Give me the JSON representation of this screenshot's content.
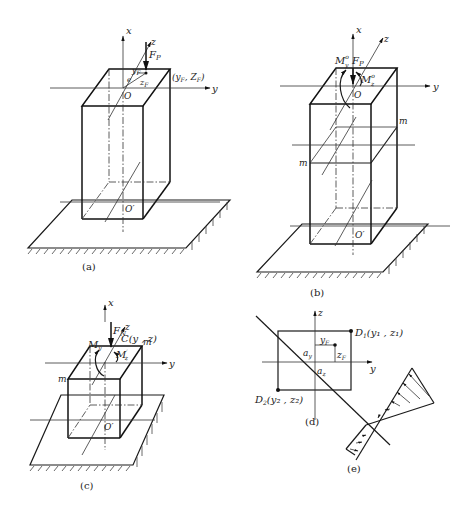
{
  "figure": {
    "panels": [
      {
        "id": "a",
        "caption": "(a)",
        "labels": {
          "x_axis": "x",
          "y_axis": "y",
          "z_axis": "z",
          "force": "F",
          "force_sub": "P",
          "origin": "O",
          "base_origin": "O′",
          "ecc": "e",
          "yF": "y",
          "yF_sub": "F",
          "zF": "z",
          "zF_sub": "F",
          "point": "(y",
          "point_sub1": "F",
          "point_mid": ", Z",
          "point_sub2": "F",
          "point_end": ")"
        }
      },
      {
        "id": "b",
        "caption": "(b)",
        "labels": {
          "x_axis": "x",
          "y_axis": "y",
          "z_axis": "z",
          "force": "F",
          "force_sub": "P",
          "moment_y": "M",
          "moment_y_sub": "y",
          "moment_y_sup": "o",
          "moment_z": "M",
          "moment_z_sub": "z",
          "moment_z_sup": "o",
          "origin": "O",
          "base_origin": "O′",
          "section_right": "m",
          "section_left": "m"
        }
      },
      {
        "id": "c",
        "caption": "(c)",
        "labels": {
          "x_axis": "x",
          "y_axis": "y",
          "z_axis": "z",
          "force": "F",
          "force_sub": "N",
          "moment_y": "M",
          "moment_y_sub": "y",
          "moment_z": "M",
          "moment_z_sub": "z",
          "moment_z_sup": "′",
          "point": "C(y , z)",
          "section_right": "m",
          "section_left": "m",
          "base_origin": "O′"
        }
      },
      {
        "id": "d",
        "caption": "(d)",
        "labels": {
          "z_axis": "z",
          "y_axis": "y",
          "d1": "D",
          "d1_sub": "1",
          "d1_coords": "(y₁ , z₁)",
          "d2": "D",
          "d2_sub": "2",
          "d2_coords": "(y₂ , z₂)",
          "yF": "y",
          "yF_sub": "F",
          "zF": "z",
          "zF_sub": "F",
          "ay": "a",
          "ay_sub": "y",
          "az": "a",
          "az_sub": "z"
        }
      },
      {
        "id": "e",
        "caption": "(e)",
        "labels": {}
      }
    ]
  }
}
